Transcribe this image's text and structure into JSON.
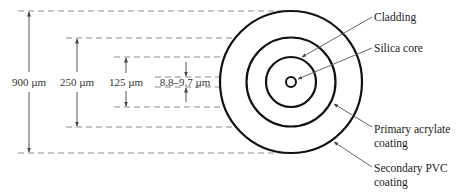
{
  "diagram": {
    "type": "optical-fiber-cross-section",
    "colors": {
      "ring": "#111111",
      "dash": "#8a8a8a",
      "leader": "#555555",
      "text": "#222222"
    },
    "dimensions": [
      {
        "id": "outer",
        "label": "900 µm"
      },
      {
        "id": "buffer",
        "label": "250 µm"
      },
      {
        "id": "cladding",
        "label": "125 µm"
      },
      {
        "id": "core",
        "label": "8.8–9.7 µm"
      }
    ],
    "layers": [
      {
        "id": "cladding",
        "label_lines": [
          "Cladding"
        ]
      },
      {
        "id": "core",
        "label_lines": [
          "Silica core"
        ]
      },
      {
        "id": "primary",
        "label_lines": [
          "Primary acrylate",
          "coating"
        ]
      },
      {
        "id": "secondary",
        "label_lines": [
          "Secondary PVC",
          "coating"
        ]
      }
    ]
  }
}
